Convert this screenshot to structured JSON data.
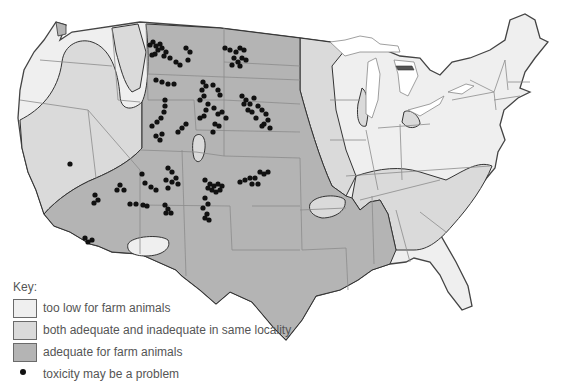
{
  "map": {
    "subject": "United States map of selenium levels in soil/forage for farm animals",
    "colors": {
      "too_low": "#efefef",
      "mixed": "#dadada",
      "adequate": "#b4b4b4",
      "border": "#444444",
      "state_line": "#8c8c8c",
      "dot": "#111111",
      "water": "#ffffff"
    }
  },
  "legend": {
    "title": "Key:",
    "items": [
      {
        "label": "too low for farm animals",
        "color": "#efefef"
      },
      {
        "label": "both adequate and inadequate in same locality",
        "color": "#dadada"
      },
      {
        "label": "adequate for farm animals",
        "color": "#b4b4b4"
      }
    ],
    "marker": {
      "label": "toxicity may be a problem",
      "symbol": "black-dot"
    }
  },
  "toxicity_points": [
    [
      150,
      45
    ],
    [
      153,
      42
    ],
    [
      156,
      46
    ],
    [
      160,
      44
    ],
    [
      158,
      50
    ],
    [
      155,
      54
    ],
    [
      162,
      48
    ],
    [
      152,
      55
    ],
    [
      164,
      56
    ],
    [
      166,
      52
    ],
    [
      170,
      58
    ],
    [
      176,
      62
    ],
    [
      180,
      65
    ],
    [
      186,
      48
    ],
    [
      190,
      52
    ],
    [
      188,
      60
    ],
    [
      225,
      48
    ],
    [
      230,
      50
    ],
    [
      236,
      52
    ],
    [
      240,
      48
    ],
    [
      244,
      50
    ],
    [
      234,
      58
    ],
    [
      238,
      62
    ],
    [
      242,
      58
    ],
    [
      246,
      60
    ],
    [
      240,
      66
    ],
    [
      232,
      65
    ],
    [
      156,
      80
    ],
    [
      162,
      82
    ],
    [
      168,
      84
    ],
    [
      174,
      84
    ],
    [
      203,
      82
    ],
    [
      206,
      86
    ],
    [
      202,
      90
    ],
    [
      213,
      85
    ],
    [
      218,
      90
    ],
    [
      220,
      95
    ],
    [
      165,
      100
    ],
    [
      165,
      106
    ],
    [
      164,
      112
    ],
    [
      161,
      118
    ],
    [
      157,
      122
    ],
    [
      152,
      126
    ],
    [
      178,
      132
    ],
    [
      182,
      128
    ],
    [
      186,
      124
    ],
    [
      156,
      136
    ],
    [
      160,
      140
    ],
    [
      162,
      134
    ],
    [
      200,
      100
    ],
    [
      204,
      96
    ],
    [
      208,
      104
    ],
    [
      206,
      110
    ],
    [
      204,
      116
    ],
    [
      200,
      118
    ],
    [
      214,
      108
    ],
    [
      218,
      114
    ],
    [
      222,
      112
    ],
    [
      226,
      118
    ],
    [
      215,
      124
    ],
    [
      219,
      126
    ],
    [
      213,
      132
    ],
    [
      242,
      96
    ],
    [
      246,
      100
    ],
    [
      250,
      104
    ],
    [
      254,
      98
    ],
    [
      258,
      106
    ],
    [
      262,
      110
    ],
    [
      266,
      114
    ],
    [
      268,
      120
    ],
    [
      264,
      124
    ],
    [
      270,
      128
    ],
    [
      244,
      104
    ],
    [
      248,
      110
    ],
    [
      252,
      112
    ],
    [
      256,
      118
    ],
    [
      262,
      126
    ],
    [
      70,
      164
    ],
    [
      95,
      195
    ],
    [
      98,
      200
    ],
    [
      94,
      203
    ],
    [
      120,
      185
    ],
    [
      124,
      190
    ],
    [
      117,
      190
    ],
    [
      168,
      168
    ],
    [
      172,
      172
    ],
    [
      176,
      178
    ],
    [
      172,
      182
    ],
    [
      178,
      184
    ],
    [
      166,
      180
    ],
    [
      168,
      188
    ],
    [
      205,
      180
    ],
    [
      210,
      184
    ],
    [
      214,
      186
    ],
    [
      218,
      184
    ],
    [
      222,
      186
    ],
    [
      212,
      190
    ],
    [
      216,
      192
    ],
    [
      208,
      188
    ],
    [
      220,
      190
    ],
    [
      240,
      182
    ],
    [
      245,
      180
    ],
    [
      250,
      178
    ],
    [
      255,
      178
    ],
    [
      260,
      172
    ],
    [
      264,
      174
    ],
    [
      258,
      184
    ],
    [
      252,
      184
    ],
    [
      268,
      172
    ],
    [
      142,
      174
    ],
    [
      145,
      183
    ],
    [
      151,
      187
    ],
    [
      156,
      190
    ],
    [
      130,
      204
    ],
    [
      136,
      204
    ],
    [
      143,
      205
    ],
    [
      147,
      206
    ],
    [
      165,
      205
    ],
    [
      168,
      209
    ],
    [
      166,
      213
    ],
    [
      171,
      213
    ],
    [
      205,
      198
    ],
    [
      208,
      204
    ],
    [
      203,
      208
    ],
    [
      207,
      214
    ],
    [
      205,
      218
    ],
    [
      209,
      220
    ],
    [
      85,
      238
    ],
    [
      88,
      242
    ],
    [
      92,
      240
    ]
  ]
}
